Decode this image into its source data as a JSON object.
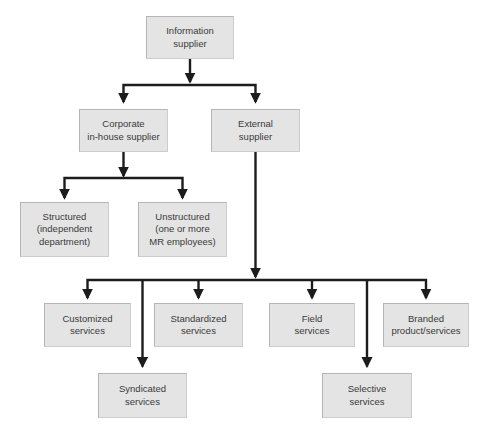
{
  "diagram": {
    "type": "tree",
    "nodes": {
      "information_supplier": {
        "label": "Information\nsupplier"
      },
      "corporate_in_house_supplier": {
        "label": "Corporate\nin-house supplier"
      },
      "external_supplier": {
        "label": "External\nsupplier"
      },
      "structured": {
        "label": "Structured\n(independent\ndepartment)"
      },
      "unstructured": {
        "label": "Unstructured\n(one or more\nMR employees)"
      },
      "customized_services": {
        "label": "Customized\nservices"
      },
      "standardized_services": {
        "label": "Standardized\nservices"
      },
      "field_services": {
        "label": "Field\nservices"
      },
      "branded_product_services": {
        "label": "Branded\nproduct/services"
      },
      "syndicated_services": {
        "label": "Syndicated\nservices"
      },
      "selective_services": {
        "label": "Selective\nservices"
      }
    },
    "edges": [
      {
        "from": "information_supplier",
        "to": "corporate_in_house_supplier"
      },
      {
        "from": "information_supplier",
        "to": "external_supplier"
      },
      {
        "from": "corporate_in_house_supplier",
        "to": "structured"
      },
      {
        "from": "corporate_in_house_supplier",
        "to": "unstructured"
      },
      {
        "from": "external_supplier",
        "to": "customized_services"
      },
      {
        "from": "external_supplier",
        "to": "syndicated_services"
      },
      {
        "from": "external_supplier",
        "to": "standardized_services"
      },
      {
        "from": "external_supplier",
        "to": "field_services"
      },
      {
        "from": "external_supplier",
        "to": "selective_services"
      },
      {
        "from": "external_supplier",
        "to": "branded_product_services"
      }
    ],
    "colors": {
      "background": "#ffffff",
      "box_fill": "#e4e4e4",
      "box_border": "#b5b5b5",
      "connector": "#1c1c1c",
      "text": "#3a3a3a"
    }
  }
}
